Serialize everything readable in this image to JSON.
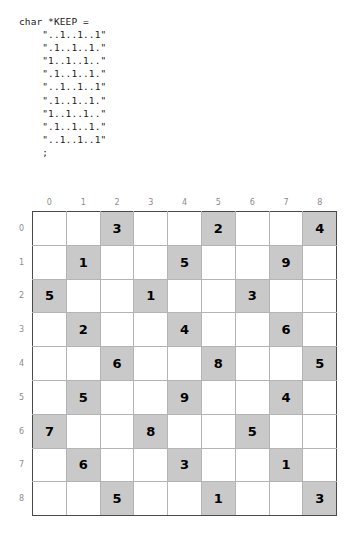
{
  "code": {
    "lines": [
      "char *KEEP =",
      "    \"..1..1..1\"",
      "    \".1..1..1.\"",
      "    \"1..1..1..\"",
      "    \".1..1..1.\"",
      "    \"..1..1..1\"",
      "    \".1..1..1.\"",
      "    \"1..1..1..\"",
      "    \".1..1..1.\"",
      "    \"..1..1..1\"",
      "    ;"
    ]
  },
  "grid": {
    "column_headers": [
      "0",
      "1",
      "2",
      "3",
      "4",
      "5",
      "6",
      "7",
      "8"
    ],
    "row_headers": [
      "0",
      "1",
      "2",
      "3",
      "4",
      "5",
      "6",
      "7",
      "8"
    ],
    "shaded_color": "#c9c9c9",
    "cell_color": "#ffffff",
    "border_color": "#b4b4b4",
    "block_border_color": "#4a4a4a",
    "rows": [
      [
        {
          "value": "",
          "shaded": false
        },
        {
          "value": "",
          "shaded": false
        },
        {
          "value": "3",
          "shaded": true
        },
        {
          "value": "",
          "shaded": false
        },
        {
          "value": "",
          "shaded": false
        },
        {
          "value": "2",
          "shaded": true
        },
        {
          "value": "",
          "shaded": false
        },
        {
          "value": "",
          "shaded": false
        },
        {
          "value": "4",
          "shaded": true
        }
      ],
      [
        {
          "value": "",
          "shaded": false
        },
        {
          "value": "1",
          "shaded": true
        },
        {
          "value": "",
          "shaded": false
        },
        {
          "value": "",
          "shaded": false
        },
        {
          "value": "5",
          "shaded": true
        },
        {
          "value": "",
          "shaded": false
        },
        {
          "value": "",
          "shaded": false
        },
        {
          "value": "9",
          "shaded": true
        },
        {
          "value": "",
          "shaded": false
        }
      ],
      [
        {
          "value": "5",
          "shaded": true
        },
        {
          "value": "",
          "shaded": false
        },
        {
          "value": "",
          "shaded": false
        },
        {
          "value": "1",
          "shaded": true
        },
        {
          "value": "",
          "shaded": false
        },
        {
          "value": "",
          "shaded": false
        },
        {
          "value": "3",
          "shaded": true
        },
        {
          "value": "",
          "shaded": false
        },
        {
          "value": "",
          "shaded": false
        }
      ],
      [
        {
          "value": "",
          "shaded": false
        },
        {
          "value": "2",
          "shaded": true
        },
        {
          "value": "",
          "shaded": false
        },
        {
          "value": "",
          "shaded": false
        },
        {
          "value": "4",
          "shaded": true
        },
        {
          "value": "",
          "shaded": false
        },
        {
          "value": "",
          "shaded": false
        },
        {
          "value": "6",
          "shaded": true
        },
        {
          "value": "",
          "shaded": false
        }
      ],
      [
        {
          "value": "",
          "shaded": false
        },
        {
          "value": "",
          "shaded": false
        },
        {
          "value": "6",
          "shaded": true
        },
        {
          "value": "",
          "shaded": false
        },
        {
          "value": "",
          "shaded": false
        },
        {
          "value": "8",
          "shaded": true
        },
        {
          "value": "",
          "shaded": false
        },
        {
          "value": "",
          "shaded": false
        },
        {
          "value": "5",
          "shaded": true
        }
      ],
      [
        {
          "value": "",
          "shaded": false
        },
        {
          "value": "5",
          "shaded": true
        },
        {
          "value": "",
          "shaded": false
        },
        {
          "value": "",
          "shaded": false
        },
        {
          "value": "9",
          "shaded": true
        },
        {
          "value": "",
          "shaded": false
        },
        {
          "value": "",
          "shaded": false
        },
        {
          "value": "4",
          "shaded": true
        },
        {
          "value": "",
          "shaded": false
        }
      ],
      [
        {
          "value": "7",
          "shaded": true
        },
        {
          "value": "",
          "shaded": false
        },
        {
          "value": "",
          "shaded": false
        },
        {
          "value": "8",
          "shaded": true
        },
        {
          "value": "",
          "shaded": false
        },
        {
          "value": "",
          "shaded": false
        },
        {
          "value": "5",
          "shaded": true
        },
        {
          "value": "",
          "shaded": false
        },
        {
          "value": "",
          "shaded": false
        }
      ],
      [
        {
          "value": "",
          "shaded": false
        },
        {
          "value": "6",
          "shaded": true
        },
        {
          "value": "",
          "shaded": false
        },
        {
          "value": "",
          "shaded": false
        },
        {
          "value": "3",
          "shaded": true
        },
        {
          "value": "",
          "shaded": false
        },
        {
          "value": "",
          "shaded": false
        },
        {
          "value": "1",
          "shaded": true
        },
        {
          "value": "",
          "shaded": false
        }
      ],
      [
        {
          "value": "",
          "shaded": false
        },
        {
          "value": "",
          "shaded": false
        },
        {
          "value": "5",
          "shaded": true
        },
        {
          "value": "",
          "shaded": false
        },
        {
          "value": "",
          "shaded": false
        },
        {
          "value": "1",
          "shaded": true
        },
        {
          "value": "",
          "shaded": false
        },
        {
          "value": "",
          "shaded": false
        },
        {
          "value": "3",
          "shaded": true
        }
      ]
    ]
  }
}
